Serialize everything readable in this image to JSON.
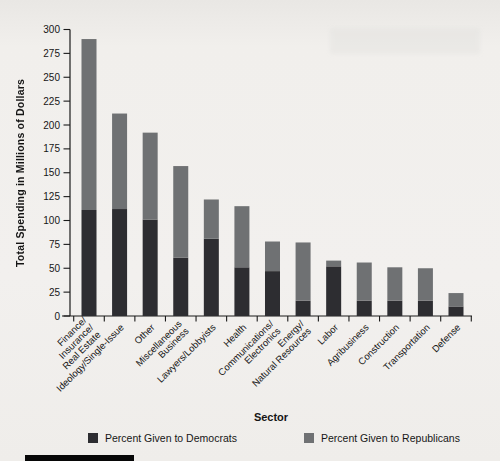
{
  "chart_data": {
    "type": "bar",
    "stacked": true,
    "title": "",
    "xlabel": "Sector",
    "ylabel": "Total Spending in Millions of Dollars",
    "ylim": [
      0,
      300
    ],
    "ytick_step": 25,
    "grid": false,
    "legend_position": "bottom",
    "categories": [
      "Finance/Insurance/Real Estate",
      "Ideology/Single-Issue",
      "Other",
      "Miscellaneous Business",
      "Lawyers/Lobbyists",
      "Health",
      "Communications/Electronics",
      "Energy/Natural Resources",
      "Labor",
      "Agribusiness",
      "Construction",
      "Transportation",
      "Defense"
    ],
    "category_lines": [
      [
        "Finance/",
        "Insurance/",
        "Real Estate"
      ],
      [
        "Ideology/Single-Issue"
      ],
      [
        "Other"
      ],
      [
        "Miscellaneous",
        "Business"
      ],
      [
        "Lawyers/Lobbyists"
      ],
      [
        "Health"
      ],
      [
        "Communications/",
        "Electronics"
      ],
      [
        "Energy/",
        "Natural Resources"
      ],
      [
        "Labor"
      ],
      [
        "Agribusiness"
      ],
      [
        "Construction"
      ],
      [
        "Transportation"
      ],
      [
        "Defense"
      ]
    ],
    "series": [
      {
        "name": "Percent Given to Democrats",
        "color": "#2d2d31",
        "values": [
          111,
          112,
          101,
          61,
          81,
          51,
          47,
          16,
          52,
          16,
          16,
          16,
          10
        ]
      },
      {
        "name": "Percent Given to Republicans",
        "color": "#6f7173",
        "values": [
          179,
          100,
          91,
          96,
          41,
          64,
          31,
          61,
          6,
          40,
          35,
          34,
          14
        ]
      }
    ],
    "totals": [
      290,
      212,
      192,
      157,
      122,
      115,
      78,
      77,
      58,
      56,
      51,
      50,
      24
    ]
  },
  "colors": {
    "axis": "#1a1a1a",
    "text": "#161616",
    "background": "#f1efec",
    "corner_bar": "#070707"
  }
}
